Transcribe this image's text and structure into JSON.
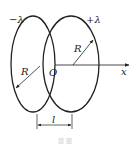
{
  "diagram": {
    "labels": {
      "left_charge": "−λ",
      "right_charge": "+λ",
      "left_radius": "R",
      "right_radius": "R",
      "origin": "O",
      "axis": "x",
      "separation": "l"
    },
    "caption": "题 图"
  }
}
